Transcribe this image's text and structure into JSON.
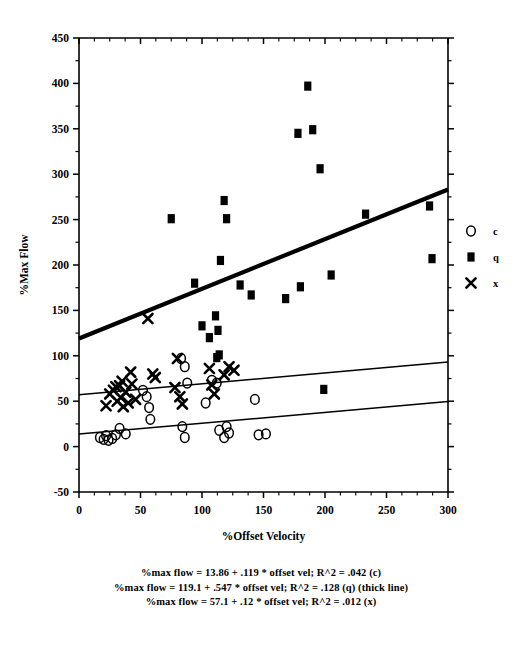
{
  "chart_data": {
    "type": "scatter",
    "title": "",
    "xlabel": "%Offset Velocity",
    "ylabel": "%Max Flow",
    "xlim": [
      0,
      300
    ],
    "ylim": [
      -50,
      450
    ],
    "xticks": [
      0,
      50,
      100,
      150,
      200,
      250,
      300
    ],
    "yticks": [
      -50,
      0,
      50,
      100,
      150,
      200,
      250,
      300,
      350,
      400,
      450
    ],
    "xtick_labels": [
      "0",
      "50",
      "100",
      "150",
      "200",
      "250",
      "300"
    ],
    "ytick_labels": [
      "-50",
      "0",
      "50",
      "100",
      "150",
      "200",
      "250",
      "300",
      "350",
      "400",
      "450"
    ],
    "minor_tick_step_x": 12.5,
    "minor_tick_step_y": 25,
    "grid": false,
    "legend_position": "right",
    "series": [
      {
        "name": "c",
        "marker": "open-circle",
        "points": [
          [
            17,
            10
          ],
          [
            20,
            8
          ],
          [
            22,
            12
          ],
          [
            24,
            7
          ],
          [
            27,
            9
          ],
          [
            30,
            13
          ],
          [
            33,
            20
          ],
          [
            38,
            14
          ],
          [
            52,
            62
          ],
          [
            55,
            55
          ],
          [
            57,
            43
          ],
          [
            58,
            30
          ],
          [
            83,
            97
          ],
          [
            86,
            88
          ],
          [
            88,
            70
          ],
          [
            84,
            22
          ],
          [
            86,
            10
          ],
          [
            103,
            48
          ],
          [
            108,
            73
          ],
          [
            112,
            70
          ],
          [
            114,
            18
          ],
          [
            118,
            10
          ],
          [
            120,
            22
          ],
          [
            122,
            15
          ],
          [
            143,
            52
          ],
          [
            146,
            13
          ],
          [
            152,
            14
          ]
        ]
      },
      {
        "name": "q",
        "marker": "filled-square",
        "points": [
          [
            75,
            251
          ],
          [
            94,
            180
          ],
          [
            100,
            133
          ],
          [
            106,
            120
          ],
          [
            111,
            144
          ],
          [
            113,
            128
          ],
          [
            112,
            98
          ],
          [
            114,
            101
          ],
          [
            115,
            205
          ],
          [
            118,
            271
          ],
          [
            120,
            251
          ],
          [
            131,
            178
          ],
          [
            140,
            167
          ],
          [
            168,
            163
          ],
          [
            178,
            345
          ],
          [
            180,
            176
          ],
          [
            186,
            397
          ],
          [
            190,
            349
          ],
          [
            196,
            306
          ],
          [
            199,
            63
          ],
          [
            205,
            189
          ],
          [
            233,
            256
          ],
          [
            285,
            265
          ],
          [
            287,
            207
          ]
        ]
      },
      {
        "name": "x",
        "marker": "x-mark",
        "points": [
          [
            22,
            45
          ],
          [
            25,
            58
          ],
          [
            28,
            62
          ],
          [
            30,
            66
          ],
          [
            31,
            50
          ],
          [
            33,
            67
          ],
          [
            34,
            54
          ],
          [
            35,
            72
          ],
          [
            36,
            44
          ],
          [
            38,
            60
          ],
          [
            40,
            48
          ],
          [
            42,
            82
          ],
          [
            43,
            69
          ],
          [
            46,
            52
          ],
          [
            56,
            141
          ],
          [
            60,
            80
          ],
          [
            62,
            76
          ],
          [
            78,
            65
          ],
          [
            80,
            97
          ],
          [
            82,
            55
          ],
          [
            84,
            47
          ],
          [
            106,
            86
          ],
          [
            108,
            68
          ],
          [
            110,
            58
          ],
          [
            118,
            79
          ],
          [
            122,
            88
          ],
          [
            126,
            84
          ]
        ]
      }
    ],
    "regression_lines": [
      {
        "name": "c",
        "intercept": 13.86,
        "slope": 0.119,
        "r2": 0.042,
        "thick": false,
        "equation": "%max flow = 13.86 + .119 * offset vel; R^2 = .042 (c)"
      },
      {
        "name": "q",
        "intercept": 119.1,
        "slope": 0.547,
        "r2": 0.128,
        "thick": true,
        "equation": "%max flow = 119.1 + .547 * offset vel; R^2 = .128 (q) (thick line)"
      },
      {
        "name": "x",
        "intercept": 57.1,
        "slope": 0.12,
        "r2": 0.012,
        "thick": false,
        "equation": "%max flow = 57.1 + .12 * offset vel; R^2 = .012 (x)"
      }
    ],
    "legend": [
      {
        "marker": "open-circle",
        "label": "c"
      },
      {
        "marker": "filled-square",
        "label": "q"
      },
      {
        "marker": "x-mark",
        "label": "x"
      }
    ],
    "caption_lines": [
      "%max flow = 13.86 + .119 * offset vel; R^2 = .042 (c)",
      "%max flow = 119.1 + .547 * offset vel; R^2 = .128 (q) (thick line)",
      "%max flow = 57.1 + .12 * offset vel; R^2 = .012 (x)"
    ]
  }
}
